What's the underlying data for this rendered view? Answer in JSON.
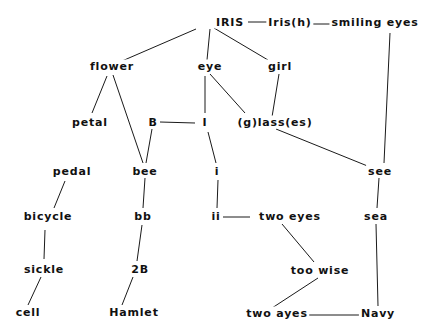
{
  "diagram": {
    "type": "word-association-network",
    "nodes": [
      {
        "id": "iris",
        "label": "IRIS",
        "x": 230,
        "y": 22
      },
      {
        "id": "irish",
        "label": "Iris(h)",
        "x": 290,
        "y": 22
      },
      {
        "id": "smiling_eyes",
        "label": "smiling eyes",
        "x": 375,
        "y": 22
      },
      {
        "id": "flower",
        "label": "flower",
        "x": 112,
        "y": 66
      },
      {
        "id": "eye",
        "label": "eye",
        "x": 210,
        "y": 66
      },
      {
        "id": "girl",
        "label": "girl",
        "x": 280,
        "y": 66
      },
      {
        "id": "petal",
        "label": "petal",
        "x": 90,
        "y": 122
      },
      {
        "id": "B",
        "label": "B",
        "x": 153,
        "y": 122
      },
      {
        "id": "I",
        "label": "I",
        "x": 205,
        "y": 122
      },
      {
        "id": "glasses",
        "label": "(g)lass(es)",
        "x": 275,
        "y": 122
      },
      {
        "id": "pedal",
        "label": "pedal",
        "x": 72,
        "y": 171
      },
      {
        "id": "bee",
        "label": "bee",
        "x": 145,
        "y": 171
      },
      {
        "id": "i_lower",
        "label": "i",
        "x": 217,
        "y": 171
      },
      {
        "id": "see",
        "label": "see",
        "x": 380,
        "y": 171
      },
      {
        "id": "bicycle",
        "label": "bicycle",
        "x": 48,
        "y": 216
      },
      {
        "id": "bb",
        "label": "bb",
        "x": 143,
        "y": 216
      },
      {
        "id": "ii",
        "label": "ii",
        "x": 216,
        "y": 216
      },
      {
        "id": "two_eyes",
        "label": "two  eyes",
        "x": 290,
        "y": 216
      },
      {
        "id": "sea",
        "label": "sea",
        "x": 376,
        "y": 216
      },
      {
        "id": "sickle",
        "label": "sickle",
        "x": 44,
        "y": 269
      },
      {
        "id": "2B",
        "label": "2B",
        "x": 140,
        "y": 269
      },
      {
        "id": "too_wise",
        "label": "too  wise",
        "x": 320,
        "y": 270
      },
      {
        "id": "cell",
        "label": "cell",
        "x": 28,
        "y": 312
      },
      {
        "id": "hamlet",
        "label": "Hamlet",
        "x": 134,
        "y": 312
      },
      {
        "id": "two_ayes",
        "label": "two  ayes",
        "x": 277,
        "y": 313
      },
      {
        "id": "navy",
        "label": "Navy",
        "x": 378,
        "y": 313
      }
    ],
    "edges": [
      {
        "from": "iris",
        "to": "irish",
        "x1": 248,
        "y1": 22,
        "x2": 268,
        "y2": 22
      },
      {
        "from": "irish",
        "to": "smiling_eyes",
        "x1": 312,
        "y1": 24,
        "x2": 340,
        "y2": 24
      },
      {
        "from": "iris",
        "to": "flower",
        "x1": 196,
        "y1": 29,
        "x2": 122,
        "y2": 61
      },
      {
        "from": "iris",
        "to": "eye",
        "x1": 210,
        "y1": 29,
        "x2": 207,
        "y2": 60
      },
      {
        "from": "iris",
        "to": "girl",
        "x1": 214,
        "y1": 28,
        "x2": 268,
        "y2": 60
      },
      {
        "from": "smiling_eyes",
        "to": "see",
        "x1": 390,
        "y1": 33,
        "x2": 384,
        "y2": 163
      },
      {
        "from": "flower",
        "to": "petal",
        "x1": 107,
        "y1": 76,
        "x2": 92,
        "y2": 113
      },
      {
        "from": "flower",
        "to": "bee",
        "x1": 113,
        "y1": 75,
        "x2": 143,
        "y2": 163
      },
      {
        "from": "B",
        "to": "bee",
        "x1": 152,
        "y1": 129,
        "x2": 146,
        "y2": 163
      },
      {
        "from": "B",
        "to": "I",
        "x1": 160,
        "y1": 122,
        "x2": 195,
        "y2": 123
      },
      {
        "from": "eye",
        "to": "I",
        "x1": 205,
        "y1": 76,
        "x2": 205,
        "y2": 113
      },
      {
        "from": "eye",
        "to": "glasses",
        "x1": 210,
        "y1": 74,
        "x2": 245,
        "y2": 113
      },
      {
        "from": "girl",
        "to": "glasses",
        "x1": 279,
        "y1": 74,
        "x2": 272,
        "y2": 117
      },
      {
        "from": "glasses",
        "to": "see",
        "x1": 276,
        "y1": 129,
        "x2": 370,
        "y2": 167
      },
      {
        "from": "I",
        "to": "i_lower",
        "x1": 208,
        "y1": 132,
        "x2": 216,
        "y2": 163
      },
      {
        "from": "pedal",
        "to": "bicycle",
        "x1": 65,
        "y1": 181,
        "x2": 54,
        "y2": 208
      },
      {
        "from": "bee",
        "to": "bb",
        "x1": 145,
        "y1": 178,
        "x2": 143,
        "y2": 208
      },
      {
        "from": "i_lower",
        "to": "ii",
        "x1": 218,
        "y1": 180,
        "x2": 217,
        "y2": 208
      },
      {
        "from": "see",
        "to": "sea",
        "x1": 379,
        "y1": 178,
        "x2": 377,
        "y2": 208
      },
      {
        "from": "bicycle",
        "to": "sickle",
        "x1": 45,
        "y1": 230,
        "x2": 44,
        "y2": 259
      },
      {
        "from": "bb",
        "to": "2B",
        "x1": 142,
        "y1": 225,
        "x2": 137,
        "y2": 261
      },
      {
        "from": "ii",
        "to": "two_eyes",
        "x1": 223,
        "y1": 217,
        "x2": 250,
        "y2": 217
      },
      {
        "from": "two_eyes",
        "to": "too_wise",
        "x1": 282,
        "y1": 224,
        "x2": 314,
        "y2": 262
      },
      {
        "from": "sea",
        "to": "navy",
        "x1": 376,
        "y1": 224,
        "x2": 378,
        "y2": 306
      },
      {
        "from": "sickle",
        "to": "cell",
        "x1": 41,
        "y1": 277,
        "x2": 28,
        "y2": 305
      },
      {
        "from": "2B",
        "to": "hamlet",
        "x1": 133,
        "y1": 277,
        "x2": 122,
        "y2": 305
      },
      {
        "from": "too_wise",
        "to": "two_ayes",
        "x1": 318,
        "y1": 278,
        "x2": 272,
        "y2": 308
      },
      {
        "from": "two_ayes",
        "to": "navy",
        "x1": 309,
        "y1": 315,
        "x2": 363,
        "y2": 315
      }
    ]
  }
}
